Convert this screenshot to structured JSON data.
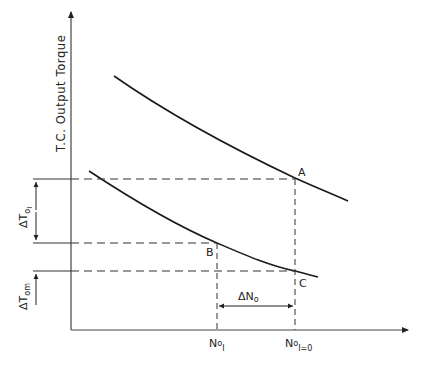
{
  "diagram": {
    "y_axis_label": "T.C. Output Torque",
    "points": {
      "A": "A",
      "B": "B",
      "C": "C"
    },
    "left_annotations": {
      "delta_T_oI": {
        "delta": "Δ",
        "base": "T",
        "sub": "o",
        "subsub": "I"
      },
      "delta_T_om": {
        "delta": "Δ",
        "base": "T",
        "sub": "om"
      }
    },
    "x_annotations": {
      "delta_N_o": {
        "delta": "Δ",
        "base": "N",
        "sub": "o"
      },
      "N_oI": {
        "base": "N",
        "sub": "o",
        "subsub": "I"
      },
      "N_oI0": {
        "base": "N",
        "sub": "o",
        "subsub": "I=0"
      }
    },
    "curves": [
      {
        "name": "upper-torque-curve",
        "passes_through": "A"
      },
      {
        "name": "lower-torque-curve",
        "passes_through": [
          "B",
          "C"
        ]
      }
    ],
    "colors": {
      "line": "#1a1a1a",
      "dash": "#333333"
    }
  }
}
